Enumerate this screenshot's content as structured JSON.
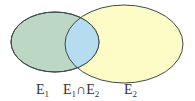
{
  "diagram": {
    "type": "venn",
    "sets": [
      {
        "id": "E1",
        "label": "E",
        "subscript": "1",
        "color": "#bcd8c4"
      },
      {
        "id": "E2",
        "label": "E",
        "subscript": "2",
        "color": "#fdfbc6"
      }
    ],
    "intersection": {
      "label_a": "E",
      "sub_a": "1",
      "symbol": "∩",
      "label_b": "E",
      "sub_b": "2",
      "color": "#b5dcef"
    },
    "stroke_color": "#3b4a48"
  }
}
